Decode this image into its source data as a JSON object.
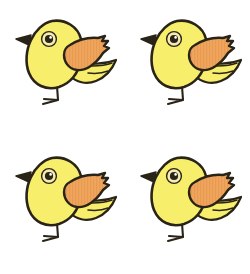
{
  "image": {
    "title": "Four Yellow Cartoon Birds",
    "description": "A 2 by 2 grid of four identical yellow cartoon bird illustrations on a plain white background.",
    "width": 250,
    "height": 274,
    "background_color": "#ffffff",
    "subject_count": 4,
    "layout": "2x2 grid"
  },
  "palette": {
    "background": "#ffffff",
    "body_fill": "#f7ee6b",
    "body_fill_shade": "#f2e55c",
    "wing_fill": "#f0a55e",
    "wing_stripe": "#e89a50",
    "outline": "#2a2418",
    "beak_fill": "#2a2418",
    "eye_outer": "#f5ecb0",
    "eye_ring": "#3a3220",
    "eye_pupil": "#2a2418",
    "eye_highlight": "#ffffff",
    "leg": "#2a2418"
  },
  "bird": {
    "name": "yellow-cartoon-bird",
    "parts": [
      {
        "key": "body",
        "label": "Body",
        "color": "#f7ee6b"
      },
      {
        "key": "head",
        "label": "Head",
        "color": "#f7ee6b"
      },
      {
        "key": "beak",
        "label": "Beak",
        "color": "#2a2418"
      },
      {
        "key": "eye",
        "label": "Eye",
        "color": "#2a2418"
      },
      {
        "key": "wing",
        "label": "Wing",
        "color": "#f0a55e"
      },
      {
        "key": "tail",
        "label": "Tail",
        "color": "#f7ee6b"
      },
      {
        "key": "leg",
        "label": "Leg and Foot",
        "color": "#2a2418"
      }
    ]
  },
  "birds": [
    {
      "id": "bird-1",
      "position": "top-left",
      "row": 1,
      "column": 1
    },
    {
      "id": "bird-2",
      "position": "top-right",
      "row": 1,
      "column": 2
    },
    {
      "id": "bird-3",
      "position": "bottom-left",
      "row": 2,
      "column": 1
    },
    {
      "id": "bird-4",
      "position": "bottom-right",
      "row": 2,
      "column": 2
    }
  ]
}
